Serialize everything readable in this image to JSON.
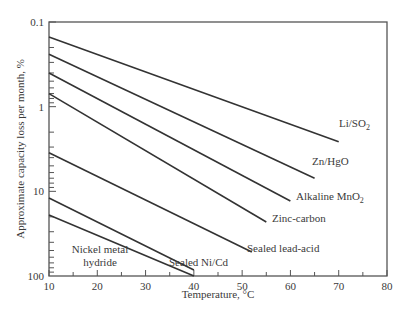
{
  "chart_data": {
    "type": "line",
    "title": "",
    "xlabel": "Temperature, °C",
    "ylabel": "Approximate capacity loss per month, %",
    "xlim": [
      10,
      80
    ],
    "ylim": [
      0.1,
      100
    ],
    "yscale": "log",
    "yinverted": true,
    "grid": false,
    "legend": "inline labels at line ends",
    "xticks": [
      "10",
      "20",
      "30",
      "40",
      "50",
      "60",
      "70",
      "80"
    ],
    "yticks": [
      "0.1",
      "1",
      "10",
      "100"
    ],
    "series": [
      {
        "name": "Li/SO₂",
        "x": [
          10,
          70
        ],
        "y": [
          0.15,
          2.6
        ]
      },
      {
        "name": "Zn/HgO",
        "x": [
          10,
          65
        ],
        "y": [
          0.24,
          7.0
        ]
      },
      {
        "name": "Alkaline MnO₂",
        "x": [
          10,
          60
        ],
        "y": [
          0.4,
          13
        ]
      },
      {
        "name": "Zinc-carbon",
        "x": [
          10,
          55
        ],
        "y": [
          0.7,
          23
        ]
      },
      {
        "name": "Sealed lead-acid",
        "x": [
          10,
          52
        ],
        "y": [
          3.5,
          52
        ]
      },
      {
        "name": "Sealed Ni/Cd",
        "x": [
          10,
          40
        ],
        "y": [
          12,
          85
        ]
      },
      {
        "name": "Nickel metal hydride",
        "x": [
          10,
          40
        ],
        "y": [
          19,
          100
        ]
      }
    ]
  },
  "labels": {
    "li": "Li/SO",
    "li_sub": "2",
    "zn": "Zn/HgO",
    "alk": "Alkaline MnO",
    "alk_sub": "2",
    "zc": "Zinc-carbon",
    "sla": "Sealed lead-acid",
    "nicd": "Sealed Ni/Cd",
    "nimh1": "Nickel metal",
    "nimh2": "hydride"
  }
}
